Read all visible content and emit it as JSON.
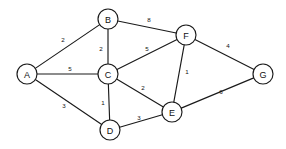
{
  "diagram": {
    "type": "weighted-undirected-graph",
    "title": "",
    "width": 286,
    "height": 149,
    "background_color": "#ffffff",
    "line_color": "#1a1a1a",
    "text_color": "#111111",
    "node_radius": 10,
    "nodes": [
      {
        "id": "A",
        "label": "A",
        "x": 27,
        "y": 74
      },
      {
        "id": "B",
        "label": "B",
        "x": 108,
        "y": 19
      },
      {
        "id": "C",
        "label": "C",
        "x": 108,
        "y": 74
      },
      {
        "id": "D",
        "label": "D",
        "x": 110,
        "y": 130
      },
      {
        "id": "E",
        "label": "E",
        "x": 172,
        "y": 112
      },
      {
        "id": "F",
        "label": "F",
        "x": 186,
        "y": 35
      },
      {
        "id": "G",
        "label": "G",
        "x": 263,
        "y": 74
      }
    ],
    "edges": [
      {
        "from": "A",
        "to": "B",
        "weight": "2",
        "lx": 63,
        "ly": 39
      },
      {
        "from": "A",
        "to": "C",
        "weight": "5",
        "lx": 70,
        "ly": 68
      },
      {
        "from": "A",
        "to": "D",
        "weight": "3",
        "lx": 64,
        "ly": 105
      },
      {
        "from": "B",
        "to": "C",
        "weight": "2",
        "lx": 101,
        "ly": 48
      },
      {
        "from": "B",
        "to": "F",
        "weight": "8",
        "lx": 149,
        "ly": 19
      },
      {
        "from": "C",
        "to": "F",
        "weight": "5",
        "lx": 147,
        "ly": 48
      },
      {
        "from": "C",
        "to": "E",
        "weight": "2",
        "lx": 143,
        "ly": 87
      },
      {
        "from": "C",
        "to": "D",
        "weight": "1",
        "lx": 103,
        "ly": 102
      },
      {
        "from": "D",
        "to": "E",
        "weight": "3",
        "lx": 139,
        "ly": 117
      },
      {
        "from": "E",
        "to": "F",
        "weight": "1",
        "lx": 187,
        "ly": 71
      },
      {
        "from": "E",
        "to": "G",
        "weight": "6",
        "lx": 221,
        "ly": 91
      },
      {
        "from": "F",
        "to": "G",
        "weight": "4",
        "lx": 228,
        "ly": 45
      }
    ]
  }
}
